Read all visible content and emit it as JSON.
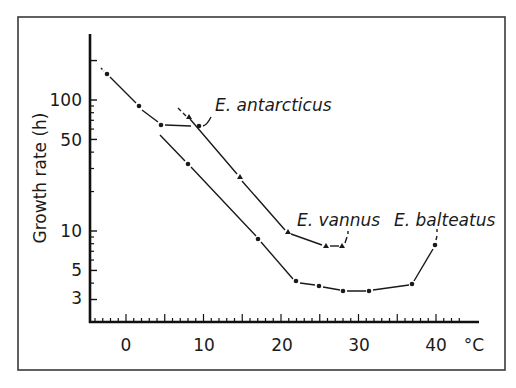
{
  "chart_data": {
    "type": "line",
    "title": "",
    "xlabel": "°C",
    "ylabel": "Growth rate (h)",
    "xlim": [
      -4.5,
      45.5
    ],
    "ylim": [
      1.9,
      300
    ],
    "yscale": "log",
    "x_ticks": [
      0,
      10,
      20,
      30,
      40
    ],
    "x_tick_labels": [
      "0",
      "10",
      "20",
      "30",
      "40"
    ],
    "y_ticks": [
      3,
      5,
      10,
      50,
      100
    ],
    "y_tick_labels": [
      "3",
      "5",
      "10",
      "50",
      "100"
    ],
    "grid": false,
    "legend": "inline labels",
    "series": [
      {
        "name": "E. antarcticus",
        "marker": "circle",
        "x": [
          -2.5,
          1.5,
          4.5
        ],
        "y": [
          170,
          95,
          65
        ]
      },
      {
        "name": "E. antarcticus (plateau)",
        "marker": "circle",
        "x": [
          4.5,
          9.5
        ],
        "y": [
          65,
          62
        ]
      },
      {
        "name": "E. vannus",
        "marker": "triangle",
        "x": [
          8,
          14.5,
          20.5,
          25.8,
          28
        ],
        "y": [
          72,
          23,
          9.5,
          7.5,
          7.5
        ]
      },
      {
        "name": "E. balteatus",
        "marker": "circle",
        "x": [
          8,
          17,
          22,
          25,
          28,
          31.5,
          37,
          40
        ],
        "y": [
          31,
          8.6,
          4.3,
          3.8,
          3.5,
          3.5,
          3.9,
          7.7
        ]
      }
    ],
    "annotations": [
      {
        "text": "E. antarcticus",
        "x": 11,
        "y": 100
      },
      {
        "text": "E. vannus",
        "x": 22.5,
        "y": 12
      },
      {
        "text": "E. balteatus",
        "x": 36,
        "y": 12
      }
    ]
  },
  "axes": {
    "ylabel": "Growth rate (h)",
    "xunit": "°C",
    "x_ticks": [
      "0",
      "10",
      "20",
      "30",
      "40"
    ],
    "y_ticks": [
      "100",
      "50",
      "10",
      "5",
      "3"
    ]
  },
  "labels": {
    "antarcticus": "E. antarcticus",
    "vannus": "E. vannus",
    "balteatus": "E. balteatus"
  },
  "colors": {
    "line": "#1a1a1a",
    "frame": "#3a3a3a",
    "background": "#ffffff"
  }
}
